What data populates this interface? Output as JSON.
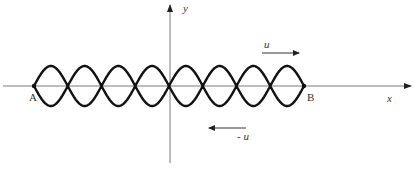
{
  "diagram": {
    "axes": {
      "x_label": "x",
      "y_label": "y",
      "colors": {
        "axis": "#7a7a7a"
      }
    },
    "endpoints": {
      "left_label": "A",
      "right_label": "B"
    },
    "wave": {
      "type": "standing-wave envelope",
      "loops": 8,
      "nodes": 9,
      "color": "#111111"
    },
    "velocity_arrows": [
      {
        "label": "u",
        "direction": "right"
      },
      {
        "label": "- u",
        "direction": "left"
      }
    ]
  }
}
